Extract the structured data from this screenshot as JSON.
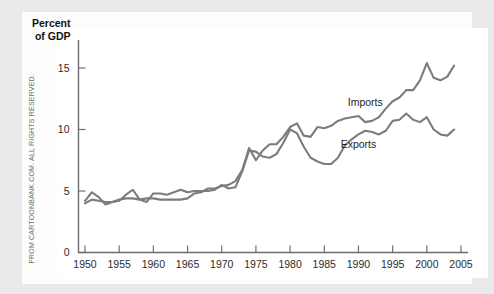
{
  "page": {
    "background_color": "#eaeaea",
    "card_color": "#ffffff",
    "copyright_notice": "FROM CARTOONBANK.COM. ALL RIGHTS RESERVED."
  },
  "chart_data": {
    "type": "line",
    "title": "",
    "subtitle": "",
    "xlabel": "",
    "ylabel": "Percent of GDP",
    "ylabel_lines": [
      "Percent",
      "of GDP"
    ],
    "xlim": [
      1948,
      2005
    ],
    "ylim": [
      0,
      17
    ],
    "yticks": [
      0,
      5,
      10,
      15
    ],
    "ytick_labels": [
      "0",
      "5",
      "10",
      "15"
    ],
    "xticks": [
      1950,
      1955,
      1960,
      1965,
      1970,
      1975,
      1980,
      1985,
      1990,
      1995,
      2000,
      2005
    ],
    "xtick_labels": [
      "1950",
      "1955",
      "1960",
      "1965",
      "1970",
      "1975",
      "1980",
      "1985",
      "1990",
      "1995",
      "2000",
      "2005"
    ],
    "grid": false,
    "legend_position": "inline-annotations",
    "line_color": "#7c7c7c",
    "x": [
      1950,
      1951,
      1952,
      1953,
      1954,
      1955,
      1956,
      1957,
      1958,
      1959,
      1960,
      1961,
      1962,
      1963,
      1964,
      1965,
      1966,
      1967,
      1968,
      1969,
      1970,
      1971,
      1972,
      1973,
      1974,
      1975,
      1976,
      1977,
      1978,
      1979,
      1980,
      1981,
      1982,
      1983,
      1984,
      1985,
      1986,
      1987,
      1988,
      1989,
      1990,
      1991,
      1992,
      1993,
      1994,
      1995,
      1996,
      1997,
      1998,
      1999,
      2000,
      2001,
      2002,
      2003,
      2004
    ],
    "series": [
      {
        "name": "Imports",
        "label": "Imports",
        "color": "#7c7c7c",
        "values": [
          4.0,
          4.3,
          4.2,
          4.1,
          4.1,
          4.3,
          4.4,
          4.4,
          4.3,
          4.4,
          4.4,
          4.3,
          4.3,
          4.3,
          4.3,
          4.4,
          4.8,
          4.9,
          5.2,
          5.2,
          5.4,
          5.5,
          5.8,
          6.7,
          8.5,
          7.5,
          8.3,
          8.8,
          8.8,
          9.4,
          10.2,
          10.5,
          9.5,
          9.4,
          10.2,
          10.1,
          10.3,
          10.7,
          10.9,
          11.0,
          11.1,
          10.6,
          10.7,
          11.0,
          11.7,
          12.3,
          12.6,
          13.2,
          13.2,
          14.0,
          15.4,
          14.2,
          14.0,
          14.3,
          15.2
        ]
      },
      {
        "name": "Exports",
        "label": "Exports",
        "color": "#7c7c7c",
        "values": [
          4.2,
          4.9,
          4.5,
          3.9,
          4.1,
          4.2,
          4.7,
          5.1,
          4.3,
          4.1,
          4.8,
          4.8,
          4.7,
          4.9,
          5.1,
          4.9,
          5.0,
          5.0,
          5.0,
          5.1,
          5.5,
          5.2,
          5.3,
          6.6,
          8.3,
          8.2,
          7.8,
          7.7,
          8.0,
          8.9,
          10.0,
          9.7,
          8.6,
          7.7,
          7.4,
          7.2,
          7.2,
          7.7,
          8.7,
          9.2,
          9.6,
          9.9,
          9.8,
          9.6,
          9.9,
          10.7,
          10.8,
          11.3,
          10.8,
          10.6,
          11.0,
          10.0,
          9.6,
          9.5,
          10.0
        ]
      }
    ],
    "annotations": [
      {
        "text": "Imports",
        "x": 1991,
        "y": 11.9
      },
      {
        "text": "Exports",
        "x": 1990,
        "y": 8.5
      }
    ]
  }
}
